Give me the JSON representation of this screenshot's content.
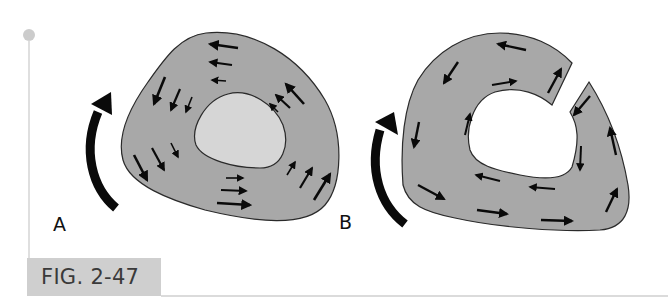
{
  "figure": {
    "caption": "FIG. 2-47",
    "panels": [
      {
        "id": "A",
        "label": "A",
        "description": "Closed ring: shear-flow arrows circulate around intact cross-section with opposing flows on each side"
      },
      {
        "id": "B",
        "label": "B",
        "description": "Split ring: cut section with shear flow arrows running continuously around the open wall"
      }
    ],
    "rotation_arrows": [
      {
        "panel": "A",
        "direction": "counterclockwise-up"
      },
      {
        "panel": "B",
        "direction": "counterclockwise-up"
      }
    ]
  },
  "colors": {
    "section_fill": "#a8a8a8",
    "hole_fill_A": "#d6d6d6",
    "hole_fill_B": "#ffffff",
    "outline": "#2a2a2a",
    "arrow": "#0a0a0a",
    "caption_bg": "#cfcfcf",
    "marker_dot": "#cccccc",
    "rule_line": "#cfcfcf"
  }
}
